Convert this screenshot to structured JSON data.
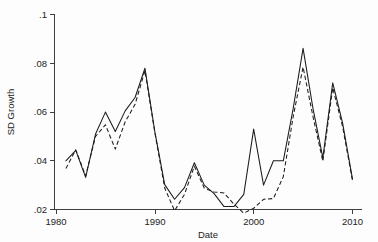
{
  "figure": {
    "background_color": "#fdfdfd",
    "line_color": "#1c1c1c"
  },
  "labels": {
    "ylabel": "SD Growth",
    "xlabel": "Date",
    "ytick_0": ".02",
    "ytick_1": ".04",
    "ytick_2": ".06",
    "ytick_3": ".08",
    "ytick_4": ".1",
    "xtick_0": "1980",
    "xtick_1": "1990",
    "xtick_2": "2000",
    "xtick_3": "2010"
  },
  "chart_data": {
    "type": "line",
    "title": "",
    "xlabel": "Date",
    "ylabel": "SD Growth",
    "xlim": [
      1980,
      2010
    ],
    "ylim": [
      0.02,
      0.1
    ],
    "xticks": [
      1980,
      1990,
      2000,
      2010
    ],
    "xticklabels": [
      "1980",
      "1990",
      "2000",
      "2010"
    ],
    "yticks": [
      0.02,
      0.04,
      0.06,
      0.08,
      0.1
    ],
    "yticklabels": [
      ".02",
      ".04",
      ".06",
      ".08",
      ".1"
    ],
    "grid": false,
    "legend": "none",
    "x": [
      1981,
      1982,
      1983,
      1984,
      1985,
      1986,
      1987,
      1988,
      1989,
      1990,
      1991,
      1992,
      1993,
      1994,
      1995,
      1996,
      1997,
      1998,
      1999,
      2000,
      2001,
      2002,
      2003,
      2004,
      2005,
      2006,
      2007,
      2008,
      2009,
      2010
    ],
    "series": [
      {
        "name": "solid-line",
        "style": "solid",
        "values": [
          0.04,
          0.0443,
          0.0332,
          0.051,
          0.06,
          0.052,
          0.0605,
          0.066,
          0.078,
          0.052,
          0.0302,
          0.0242,
          0.029,
          0.0392,
          0.03,
          0.0265,
          0.0212,
          0.0212,
          0.0262,
          0.053,
          0.03,
          0.04,
          0.04,
          0.0615,
          0.0862,
          0.0615,
          0.0412,
          0.072,
          0.0555,
          0.0325
        ]
      },
      {
        "name": "dashed-line",
        "style": "dashed",
        "values": [
          0.0368,
          0.0445,
          0.0338,
          0.05,
          0.0548,
          0.0448,
          0.056,
          0.0632,
          0.077,
          0.0516,
          0.0288,
          0.0195,
          0.0262,
          0.0378,
          0.0288,
          0.0272,
          0.0268,
          0.0222,
          0.0185,
          0.0205,
          0.0242,
          0.0245,
          0.0335,
          0.0582,
          0.0785,
          0.0582,
          0.0398,
          0.07,
          0.054,
          0.0318
        ]
      }
    ]
  }
}
